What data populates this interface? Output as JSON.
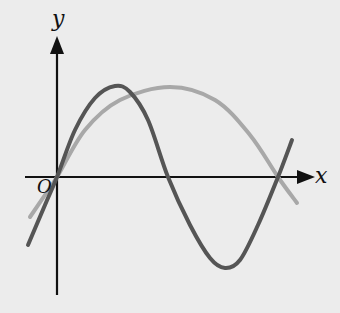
{
  "figure": {
    "type": "function-graph",
    "axes": {
      "x_label": "x",
      "y_label": "y",
      "origin_label": "O"
    },
    "curves": [
      {
        "name": "dark-curve",
        "description": "one full sine-like period: rises from below through O, peak, crosses x-axis, trough, rises back through x-axis",
        "color": "#555555",
        "points": [
          [
            28,
            245
          ],
          [
            45,
            205
          ],
          [
            57,
            177
          ],
          [
            75,
            130
          ],
          [
            95,
            98
          ],
          [
            115,
            86
          ],
          [
            130,
            92
          ],
          [
            148,
            120
          ],
          [
            168,
            177
          ],
          [
            190,
            225
          ],
          [
            210,
            258
          ],
          [
            225,
            268
          ],
          [
            240,
            260
          ],
          [
            258,
            225
          ],
          [
            278,
            177
          ],
          [
            292,
            140
          ]
        ]
      },
      {
        "name": "light-curve",
        "description": "half sine-like arch: passes through O, wide peak, crosses x-axis at same point as dark curve",
        "color": "#a8a8a8",
        "points": [
          [
            30,
            217
          ],
          [
            45,
            195
          ],
          [
            57,
            177
          ],
          [
            85,
            130
          ],
          [
            120,
            100
          ],
          [
            170,
            87
          ],
          [
            215,
            100
          ],
          [
            250,
            135
          ],
          [
            278,
            177
          ],
          [
            297,
            203
          ]
        ]
      }
    ],
    "colors": {
      "background": "#ececec",
      "axis": "#111111"
    }
  }
}
